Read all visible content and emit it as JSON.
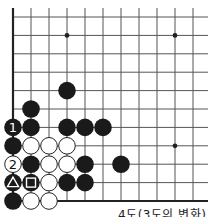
{
  "diagram": {
    "caption": "4도(3도의 변화)",
    "colors": {
      "background": "#ffffff",
      "grid": "#555555",
      "edge": "#222222",
      "black_stone": "#1a1a1a",
      "white_stone": "#ffffff",
      "white_stone_border": "#222222"
    },
    "grid": {
      "origin_x": 13,
      "origin_y": 17,
      "spacing_x": 18,
      "spacing_y": 18.4,
      "cols": 11,
      "rows": 11,
      "left_edge": true,
      "bottom_edge": true
    },
    "star_points": [
      {
        "col": 3,
        "row": 1
      },
      {
        "col": 9,
        "row": 1
      },
      {
        "col": 9,
        "row": 7
      }
    ],
    "stones": [
      {
        "col": 3,
        "row": 4,
        "color": "black"
      },
      {
        "col": 1,
        "row": 5,
        "color": "black"
      },
      {
        "col": 0,
        "row": 6,
        "color": "black",
        "label": "1"
      },
      {
        "col": 1,
        "row": 6,
        "color": "black"
      },
      {
        "col": 3,
        "row": 6,
        "color": "black"
      },
      {
        "col": 4,
        "row": 6,
        "color": "black"
      },
      {
        "col": 5,
        "row": 6,
        "color": "black"
      },
      {
        "col": 0,
        "row": 7,
        "color": "black"
      },
      {
        "col": 1,
        "row": 7,
        "color": "white"
      },
      {
        "col": 2,
        "row": 7,
        "color": "white"
      },
      {
        "col": 3,
        "row": 7,
        "color": "white"
      },
      {
        "col": 0,
        "row": 8,
        "color": "white",
        "label": "2"
      },
      {
        "col": 1,
        "row": 8,
        "color": "black"
      },
      {
        "col": 2,
        "row": 8,
        "color": "white"
      },
      {
        "col": 3,
        "row": 8,
        "color": "white"
      },
      {
        "col": 4,
        "row": 8,
        "color": "black"
      },
      {
        "col": 6,
        "row": 8,
        "color": "black"
      },
      {
        "col": 0,
        "row": 9,
        "color": "black",
        "mark": "triangle"
      },
      {
        "col": 1,
        "row": 9,
        "color": "black",
        "mark": "square"
      },
      {
        "col": 2,
        "row": 9,
        "color": "white"
      },
      {
        "col": 3,
        "row": 9,
        "color": "black"
      },
      {
        "col": 4,
        "row": 9,
        "color": "black"
      },
      {
        "col": 0,
        "row": 10,
        "color": "black"
      },
      {
        "col": 1,
        "row": 10,
        "color": "white"
      },
      {
        "col": 2,
        "row": 10,
        "color": "white"
      }
    ]
  }
}
